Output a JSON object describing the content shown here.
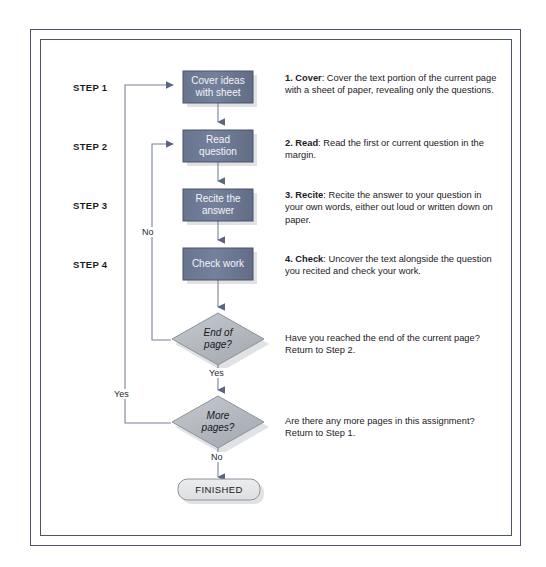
{
  "diagram": {
    "colors": {
      "process_fill": "#69758f",
      "process_fill_light": "#7c88a1",
      "process_border": "#49536b",
      "decision_fill": "#b6babf",
      "decision_fill_light": "#c8ccd2",
      "decision_border": "#8d9299",
      "terminal_fill": "#e6e7e9",
      "terminal_border": "#8d9299",
      "connector": "#7a829a",
      "arrowhead": "#5a6582",
      "frame": "#4a556b",
      "shadow": "#c9cbcf",
      "text_light": "#f2f4f8",
      "text_dark": "#16181d"
    },
    "step_labels": [
      {
        "text": "STEP 1"
      },
      {
        "text": "STEP 2"
      },
      {
        "text": "STEP 3"
      },
      {
        "text": "STEP 4"
      }
    ],
    "nodes": [
      {
        "id": "cover",
        "type": "process",
        "label": "Cover ideas\nwith sheet"
      },
      {
        "id": "read",
        "type": "process",
        "label": "Read\nquestion"
      },
      {
        "id": "recite",
        "type": "process",
        "label": "Recite the\nanswer"
      },
      {
        "id": "check",
        "type": "process",
        "label": "Check work"
      },
      {
        "id": "endpage",
        "type": "decision",
        "label": "End of\npage?"
      },
      {
        "id": "morepages",
        "type": "decision",
        "label": "More\npages?"
      },
      {
        "id": "finished",
        "type": "terminal",
        "label": "FINISHED"
      }
    ],
    "edge_labels": {
      "no_loop_to_step2": "No",
      "endpage_yes": "Yes",
      "yes_loop_to_step1": "Yes",
      "morepages_no": "No"
    },
    "descriptions": [
      {
        "id": "desc-cover",
        "heading": "1. Cover",
        "body": ": Cover the text portion of the current page with a sheet of paper, revealing only the questions."
      },
      {
        "id": "desc-read",
        "heading": "2. Read",
        "body": ": Read the first or current question in the margin."
      },
      {
        "id": "desc-recite",
        "heading": "3. Recite",
        "body": ": Recite the answer to your question in your own words, either out loud or written down on paper."
      },
      {
        "id": "desc-check",
        "heading": "4. Check",
        "body": ": Uncover the text alongside the question you recited and check your work."
      },
      {
        "id": "desc-endpage",
        "heading": "",
        "body": "Have you reached the end of the current page? Return to Step 2."
      },
      {
        "id": "desc-morepages",
        "heading": "",
        "body": "Are there any more pages in this assignment? Return to Step 1."
      }
    ]
  }
}
